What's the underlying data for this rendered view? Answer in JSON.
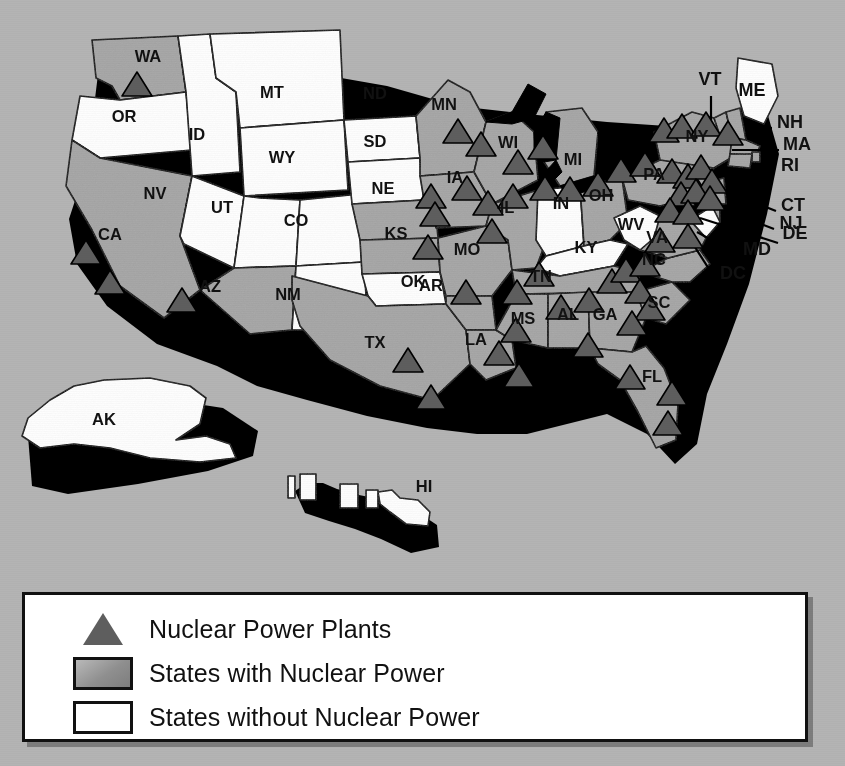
{
  "figure": {
    "kind": "thematic-choropleth-map"
  },
  "colors": {
    "background": "#b4b4b4",
    "state_with_power": "#a6a6a6",
    "state_without_power": "#ffffff",
    "plant_marker": "#5e5e5e",
    "outline": "#000000",
    "extrusion_shadow": "#000000",
    "lake": "#000000",
    "legend_background": "#ffffff",
    "label_text": "#111111"
  },
  "legend": {
    "items": [
      {
        "key": "triangle-marker",
        "label": "Nuclear Power Plants"
      },
      {
        "key": "filled-swatch",
        "label": "States with Nuclear Power"
      },
      {
        "key": "empty-swatch",
        "label": "States without Nuclear Power"
      }
    ]
  },
  "state_labels": [
    {
      "code": "WA",
      "x": 148,
      "y": 62,
      "has_power": true
    },
    {
      "code": "OR",
      "x": 124,
      "y": 122,
      "has_power": false
    },
    {
      "code": "ID",
      "x": 197,
      "y": 140,
      "has_power": false
    },
    {
      "code": "MT",
      "x": 272,
      "y": 98,
      "has_power": false
    },
    {
      "code": "WY",
      "x": 282,
      "y": 163,
      "has_power": false
    },
    {
      "code": "ND",
      "x": 375,
      "y": 99,
      "has_power": false
    },
    {
      "code": "SD",
      "x": 375,
      "y": 147,
      "has_power": false
    },
    {
      "code": "NV",
      "x": 155,
      "y": 199,
      "has_power": false
    },
    {
      "code": "UT",
      "x": 222,
      "y": 213,
      "has_power": false
    },
    {
      "code": "CO",
      "x": 296,
      "y": 226,
      "has_power": false
    },
    {
      "code": "CA",
      "x": 110,
      "y": 240,
      "has_power": true
    },
    {
      "code": "AZ",
      "x": 210,
      "y": 292,
      "has_power": true
    },
    {
      "code": "NM",
      "x": 288,
      "y": 300,
      "has_power": false
    },
    {
      "code": "NE",
      "x": 383,
      "y": 194,
      "has_power": true
    },
    {
      "code": "KS",
      "x": 396,
      "y": 239,
      "has_power": true
    },
    {
      "code": "OK",
      "x": 413,
      "y": 287,
      "has_power": false
    },
    {
      "code": "TX",
      "x": 375,
      "y": 348,
      "has_power": true
    },
    {
      "code": "MN",
      "x": 444,
      "y": 110,
      "has_power": true
    },
    {
      "code": "IA",
      "x": 455,
      "y": 183,
      "has_power": true
    },
    {
      "code": "MO",
      "x": 467,
      "y": 255,
      "has_power": true
    },
    {
      "code": "AR",
      "x": 431,
      "y": 291,
      "has_power": true
    },
    {
      "code": "LA",
      "x": 476,
      "y": 345,
      "has_power": true
    },
    {
      "code": "WI",
      "x": 508,
      "y": 148,
      "has_power": true
    },
    {
      "code": "IL",
      "x": 507,
      "y": 213,
      "has_power": true
    },
    {
      "code": "IN",
      "x": 561,
      "y": 209,
      "has_power": false
    },
    {
      "code": "MI",
      "x": 573,
      "y": 165,
      "has_power": true
    },
    {
      "code": "OH",
      "x": 601,
      "y": 201,
      "has_power": true
    },
    {
      "code": "KY",
      "x": 586,
      "y": 253,
      "has_power": false
    },
    {
      "code": "TN",
      "x": 541,
      "y": 282,
      "has_power": true
    },
    {
      "code": "MS",
      "x": 523,
      "y": 324,
      "has_power": true
    },
    {
      "code": "AL",
      "x": 568,
      "y": 320,
      "has_power": true
    },
    {
      "code": "GA",
      "x": 605,
      "y": 320,
      "has_power": true
    },
    {
      "code": "FL",
      "x": 652,
      "y": 382,
      "has_power": true
    },
    {
      "code": "SC",
      "x": 659,
      "y": 308,
      "has_power": true
    },
    {
      "code": "NC",
      "x": 654,
      "y": 265,
      "has_power": true
    },
    {
      "code": "VA",
      "x": 657,
      "y": 243,
      "has_power": true
    },
    {
      "code": "WV",
      "x": 631,
      "y": 230,
      "has_power": false
    },
    {
      "code": "PA",
      "x": 654,
      "y": 180,
      "has_power": true
    },
    {
      "code": "NY",
      "x": 697,
      "y": 142,
      "has_power": true
    },
    {
      "code": "AK",
      "x": 104,
      "y": 425,
      "has_power": false
    },
    {
      "code": "HI",
      "x": 424,
      "y": 492,
      "has_power": false
    }
  ],
  "callout_labels": [
    {
      "code": "VT",
      "x": 710,
      "y": 85,
      "line": [
        711,
        96,
        711,
        127
      ]
    },
    {
      "code": "ME",
      "x": 752,
      "y": 96,
      "line": null
    },
    {
      "code": "NH",
      "x": 790,
      "y": 128,
      "line": [
        772,
        128,
        745,
        128
      ]
    },
    {
      "code": "MA",
      "x": 797,
      "y": 150,
      "line": [
        779,
        150,
        732,
        150
      ]
    },
    {
      "code": "RI",
      "x": 790,
      "y": 171,
      "line": [
        773,
        171,
        728,
        184
      ]
    },
    {
      "code": "CT",
      "x": 793,
      "y": 211,
      "line": [
        776,
        211,
        718,
        188
      ]
    },
    {
      "code": "NJ",
      "x": 791,
      "y": 229,
      "line": [
        774,
        229,
        706,
        203
      ]
    },
    {
      "code": "DE",
      "x": 795,
      "y": 239,
      "line": [
        778,
        243,
        700,
        218
      ]
    },
    {
      "code": "MD",
      "x": 757,
      "y": 255,
      "line": [
        740,
        256,
        697,
        232
      ]
    },
    {
      "code": "DC",
      "x": 733,
      "y": 279,
      "line": [
        716,
        280,
        693,
        244
      ]
    }
  ],
  "plants": [
    {
      "x": 137,
      "y": 84
    },
    {
      "x": 86,
      "y": 252
    },
    {
      "x": 110,
      "y": 282
    },
    {
      "x": 182,
      "y": 300
    },
    {
      "x": 408,
      "y": 360
    },
    {
      "x": 431,
      "y": 397
    },
    {
      "x": 431,
      "y": 196
    },
    {
      "x": 435,
      "y": 214
    },
    {
      "x": 428,
      "y": 247
    },
    {
      "x": 458,
      "y": 131
    },
    {
      "x": 481,
      "y": 144
    },
    {
      "x": 467,
      "y": 188
    },
    {
      "x": 488,
      "y": 203
    },
    {
      "x": 513,
      "y": 196
    },
    {
      "x": 518,
      "y": 162
    },
    {
      "x": 492,
      "y": 231
    },
    {
      "x": 543,
      "y": 147
    },
    {
      "x": 545,
      "y": 188
    },
    {
      "x": 570,
      "y": 189
    },
    {
      "x": 598,
      "y": 184
    },
    {
      "x": 621,
      "y": 170
    },
    {
      "x": 645,
      "y": 164
    },
    {
      "x": 664,
      "y": 130
    },
    {
      "x": 682,
      "y": 126
    },
    {
      "x": 706,
      "y": 124
    },
    {
      "x": 728,
      "y": 133
    },
    {
      "x": 672,
      "y": 171
    },
    {
      "x": 688,
      "y": 176
    },
    {
      "x": 701,
      "y": 167
    },
    {
      "x": 712,
      "y": 181
    },
    {
      "x": 681,
      "y": 194
    },
    {
      "x": 696,
      "y": 191
    },
    {
      "x": 710,
      "y": 198
    },
    {
      "x": 670,
      "y": 210
    },
    {
      "x": 688,
      "y": 212
    },
    {
      "x": 660,
      "y": 240
    },
    {
      "x": 688,
      "y": 236
    },
    {
      "x": 466,
      "y": 292
    },
    {
      "x": 517,
      "y": 292
    },
    {
      "x": 539,
      "y": 274
    },
    {
      "x": 561,
      "y": 307
    },
    {
      "x": 589,
      "y": 300
    },
    {
      "x": 612,
      "y": 281
    },
    {
      "x": 626,
      "y": 270
    },
    {
      "x": 645,
      "y": 264
    },
    {
      "x": 640,
      "y": 291
    },
    {
      "x": 650,
      "y": 308
    },
    {
      "x": 632,
      "y": 323
    },
    {
      "x": 588,
      "y": 345
    },
    {
      "x": 516,
      "y": 330
    },
    {
      "x": 499,
      "y": 353
    },
    {
      "x": 519,
      "y": 375
    },
    {
      "x": 630,
      "y": 377
    },
    {
      "x": 672,
      "y": 393
    },
    {
      "x": 668,
      "y": 423
    }
  ]
}
